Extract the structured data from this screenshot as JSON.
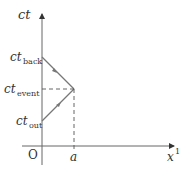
{
  "diagram": {
    "type": "spacetime-diagram",
    "axes": {
      "vertical_label": "ct",
      "horizontal_label": "x",
      "horizontal_superscript": "1",
      "origin_label": "O"
    },
    "ticks": {
      "x_tick_label": "a",
      "ct_labels": [
        {
          "base": "ct",
          "sub": "back"
        },
        {
          "base": "ct",
          "sub": "event"
        },
        {
          "base": "ct",
          "sub": "out"
        }
      ]
    },
    "colors": {
      "axis": "#555555",
      "worldline": "#777777",
      "dashed": "#555555",
      "text": "#333333"
    }
  }
}
